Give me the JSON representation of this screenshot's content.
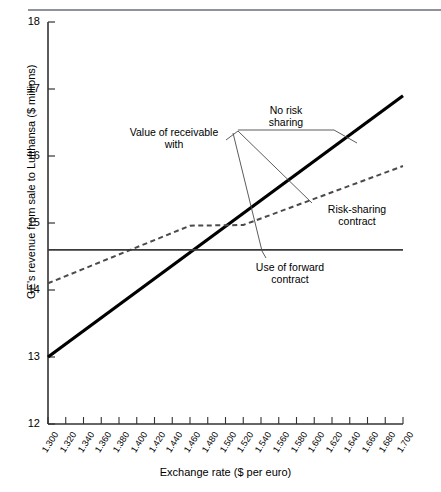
{
  "page": {
    "top_ghost_text": "",
    "background": "#ffffff"
  },
  "chart_data": {
    "type": "line",
    "title": "",
    "xlabel": "Exchange rate ($ per euro)",
    "ylabel": "GE's revenue from sale to Lufthansa ($ millions)",
    "xlim": [
      1.3,
      1.7
    ],
    "ylim": [
      12,
      18
    ],
    "grid": false,
    "legend_position": "annotations",
    "x_ticks": [
      "1.300",
      "1.320",
      "1.340",
      "1.360",
      "1.380",
      "1.400",
      "1.420",
      "1.440",
      "1.460",
      "1.480",
      "1.500",
      "1.520",
      "1.540",
      "1.560",
      "1.580",
      "1.600",
      "1.620",
      "1.640",
      "1.660",
      "1.680",
      "1.700"
    ],
    "y_ticks": [
      "12",
      "13",
      "14",
      "15",
      "16",
      "17",
      "18"
    ],
    "series": [
      {
        "name": "No risk sharing",
        "style": "solid-thick",
        "color": "#000000",
        "x": [
          1.3,
          1.7
        ],
        "values": [
          13.0,
          16.9
        ]
      },
      {
        "name": "Risk-sharing contract",
        "style": "dashed",
        "color": "#4a4a4a",
        "x": [
          1.3,
          1.46,
          1.52,
          1.7
        ],
        "values": [
          14.1,
          14.96,
          14.97,
          15.85
        ]
      },
      {
        "name": "Use of forward contract",
        "style": "solid-thin",
        "color": "#3a3a3a",
        "x": [
          1.3,
          1.7
        ],
        "values": [
          14.6,
          14.6
        ]
      }
    ],
    "annotations": [
      {
        "id": "no-risk-sharing",
        "line1": "No risk",
        "line2": "sharing"
      },
      {
        "id": "value-of-receivable",
        "line1": "Value of receivable",
        "line2": "with"
      },
      {
        "id": "risk-sharing-contract",
        "line1": "Risk-sharing",
        "line2": "contract"
      },
      {
        "id": "use-of-forward-contract",
        "line1": "Use of forward",
        "line2": "contract"
      }
    ]
  }
}
